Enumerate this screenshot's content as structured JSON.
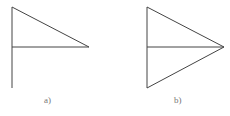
{
  "figures": [
    {
      "label": "a)",
      "description": "flag shape: vertical pole with right triangle on top half",
      "points": {
        "top": [
          12,
          7
        ],
        "mid": [
          12,
          47
        ],
        "bottom": [
          12,
          88
        ],
        "tip": [
          89,
          47
        ]
      }
    },
    {
      "label": "b)",
      "description": "isosceles triangle with median line to apex",
      "points": {
        "top": [
          147,
          7
        ],
        "mid": [
          147,
          47
        ],
        "bottom": [
          147,
          88
        ],
        "tip": [
          224,
          47
        ]
      }
    }
  ],
  "colors": {
    "stroke": "#444444",
    "label": "#777777"
  }
}
